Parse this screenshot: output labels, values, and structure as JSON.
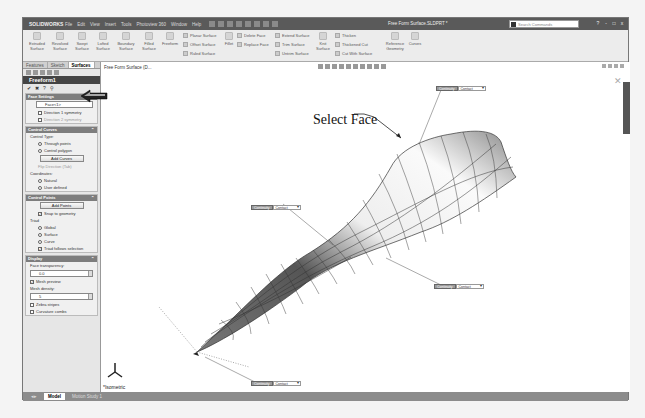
{
  "app": {
    "logo": "SOLIDWORKS",
    "document_title": "Free Form Surface.SLDPRT *",
    "menu": [
      "File",
      "Edit",
      "View",
      "Insert",
      "Tools",
      "Photoview 360",
      "Window",
      "Help"
    ],
    "search_placeholder": "Search Commands",
    "window_controls": [
      "?",
      "-",
      "□",
      "x"
    ]
  },
  "ribbon": {
    "large_buttons": [
      {
        "label": "Extruded Surface"
      },
      {
        "label": "Revolved Surface"
      },
      {
        "label": "Swept Surface"
      },
      {
        "label": "Lofted Surface"
      },
      {
        "label": "Boundary Surface"
      },
      {
        "label": "Filled Surface"
      },
      {
        "label": "Freeform"
      },
      {
        "label": "Fillet"
      },
      {
        "label": "Knit Surface"
      },
      {
        "label": "Reference Geometry"
      },
      {
        "label": "Curves"
      }
    ],
    "small_buttons": [
      {
        "label": "Planar Surface"
      },
      {
        "label": "Offset Surface"
      },
      {
        "label": "Ruled Surface"
      },
      {
        "label": "Delete Face"
      },
      {
        "label": "Replace Face"
      },
      {
        "label": "Extend Surface"
      },
      {
        "label": "Trim Surface"
      },
      {
        "label": "Untrim Surface"
      },
      {
        "label": "Thicken"
      },
      {
        "label": "Thickened Cut"
      },
      {
        "label": "Cut With Surface"
      }
    ]
  },
  "panel": {
    "tabs": [
      "Features",
      "Sketch",
      "Surfaces"
    ],
    "active_tab": "Surfaces",
    "title": "Freeform1",
    "sections": {
      "face_settings": {
        "title": "Face Settings",
        "face_field": "Face<1>",
        "direction1": "Direction 1 symmetry",
        "direction2": "Direction 2 symmetry"
      },
      "control_curves": {
        "title": "Control Curves",
        "control_type_label": "Control Type:",
        "through_points": "Through points",
        "control_polygon": "Control polygon",
        "add_curves": "Add Curves",
        "flip_direction": "Flip Direction (Tab)",
        "coordinates_label": "Coordinates:",
        "natural": "Natural",
        "user_defined": "User defined"
      },
      "control_points": {
        "title": "Control Points",
        "add_points": "Add Points",
        "snap_to_geometry": "Snap to geometry",
        "triad_label": "Triad",
        "global": "Global",
        "surface": "Surface",
        "curve": "Curve",
        "triad_follows": "Triad follows selection"
      },
      "display": {
        "title": "Display",
        "face_transparency_label": "Face transparency:",
        "face_transparency": "0.0",
        "mesh_preview": "Mesh preview",
        "mesh_density_label": "Mesh density:",
        "mesh_density": "5",
        "zebra_stripes": "Zebra stripes",
        "curvature_combs": "Curvature combs"
      }
    }
  },
  "bottom_tabs": [
    "Model",
    "Motion Study 1"
  ],
  "active_bottom_tab": "Model",
  "viewport": {
    "tree_label": "Free Form Surface  (D...",
    "annotation": "Select Face",
    "view_name": "*Isometric",
    "callouts": [
      {
        "label": "Continuity",
        "value": "Contact"
      },
      {
        "label": "Continuity",
        "value": "Contact"
      },
      {
        "label": "Continuity",
        "value": "Contact"
      },
      {
        "label": "Continuity",
        "value": "Contact"
      }
    ]
  }
}
